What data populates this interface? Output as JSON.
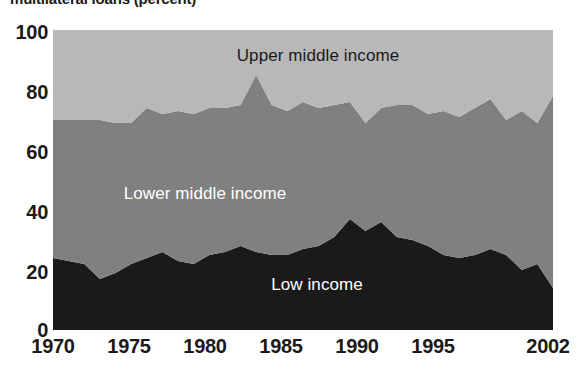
{
  "chart_data": {
    "type": "area",
    "stacked": true,
    "title": "multilateral loans (percent)",
    "xlabel": "",
    "ylabel": "",
    "xlim": [
      1970,
      2002
    ],
    "ylim": [
      0,
      100
    ],
    "grid": false,
    "legend_position": "inline-band-labels",
    "x_tick_labels": [
      "1970",
      "1975",
      "1980",
      "1985",
      "1990",
      "1995",
      "2002"
    ],
    "x_tick_values": [
      1970,
      1975,
      1980,
      1985,
      1990,
      1995,
      2002
    ],
    "y_tick_labels": [
      "0",
      "20",
      "40",
      "60",
      "80",
      "100"
    ],
    "y_tick_values": [
      0,
      20,
      40,
      60,
      80,
      100
    ],
    "x": [
      1970,
      1971,
      1972,
      1973,
      1974,
      1975,
      1976,
      1977,
      1978,
      1979,
      1980,
      1981,
      1982,
      1983,
      1984,
      1985,
      1986,
      1987,
      1988,
      1989,
      1990,
      1991,
      1992,
      1993,
      1994,
      1995,
      1996,
      1997,
      1998,
      1999,
      2000,
      2001,
      2002
    ],
    "series": [
      {
        "name": "Low income",
        "color": "#1a1a1a",
        "label_color": "#ffffff",
        "values": [
          24,
          23,
          22,
          17,
          19,
          22,
          24,
          26,
          23,
          22,
          25,
          26,
          28,
          26,
          25,
          25,
          27,
          28,
          31,
          37,
          33,
          36,
          31,
          30,
          28,
          25,
          24,
          25,
          27,
          25,
          20,
          22,
          14
        ]
      },
      {
        "name": "Lower middle income",
        "color": "#808080",
        "label_color": "#ffffff",
        "values": [
          46,
          47,
          48,
          53,
          50,
          47,
          50,
          46,
          50,
          50,
          49,
          48,
          47,
          59,
          50,
          48,
          49,
          46,
          44,
          39,
          36,
          38,
          44,
          45,
          44,
          48,
          47,
          49,
          50,
          45,
          53,
          47,
          64
        ]
      },
      {
        "name": "Upper middle income",
        "color": "#b8b8b8",
        "label_color": "#1a1a1a",
        "values": [
          30,
          30,
          30,
          30,
          31,
          31,
          26,
          28,
          27,
          28,
          26,
          26,
          25,
          15,
          25,
          27,
          24,
          26,
          25,
          24,
          31,
          26,
          25,
          25,
          28,
          27,
          29,
          26,
          23,
          30,
          27,
          31,
          22
        ]
      }
    ],
    "band_labels": [
      {
        "text": "Upper middle income",
        "series": "Upper middle income",
        "x": 318,
        "y": 61
      },
      {
        "text": "Lower middle income",
        "series": "Lower middle income",
        "x": 205,
        "y": 199
      },
      {
        "text": "Low income",
        "series": "Low income",
        "x": 317,
        "y": 290
      }
    ]
  },
  "layout": {
    "plot_left": 53,
    "plot_right": 553,
    "plot_top": 30,
    "plot_bottom": 330,
    "y_label_positions": [
      {
        "label": "100",
        "top": 22
      },
      {
        "label": "80",
        "top": 82
      },
      {
        "label": "60",
        "top": 142
      },
      {
        "label": "40",
        "top": 202
      },
      {
        "label": "20",
        "top": 262
      },
      {
        "label": "0",
        "top": 320
      }
    ],
    "x_label_positions": [
      {
        "label": "1970",
        "left": 53
      },
      {
        "label": "1975",
        "left": 129
      },
      {
        "label": "1980",
        "left": 205
      },
      {
        "label": "1985",
        "left": 281
      },
      {
        "label": "1990",
        "left": 357
      },
      {
        "label": "1995",
        "left": 433
      },
      {
        "label": "2002",
        "left": 548
      }
    ]
  }
}
